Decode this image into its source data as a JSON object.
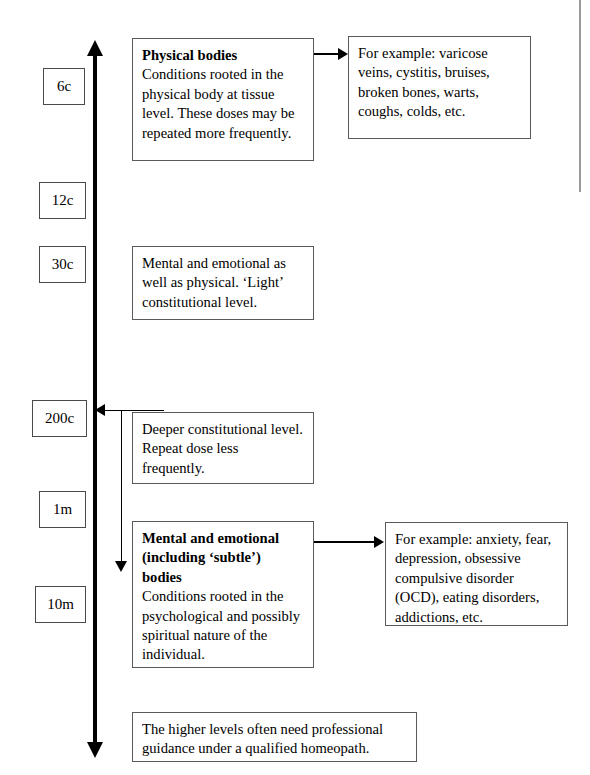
{
  "diagram": {
    "axis": {
      "name": "potency-axis",
      "direction": "vertical",
      "top_arrow": "up",
      "bottom_arrow": "down"
    },
    "potencies": [
      {
        "label": "6c",
        "id": "potency-6c"
      },
      {
        "label": "12c",
        "id": "potency-12c"
      },
      {
        "label": "30c",
        "id": "potency-30c"
      },
      {
        "label": "200c",
        "id": "potency-200c"
      },
      {
        "label": "1m",
        "id": "potency-1m"
      },
      {
        "label": "10m",
        "id": "potency-10m"
      }
    ],
    "boxes": {
      "physical": {
        "heading": "Physical bodies",
        "body": "Conditions rooted in the physical body at tissue level. These doses may be repeated more frequently."
      },
      "physical_examples": {
        "body": "For example: varicose veins, cystitis, bruises, broken bones, warts, coughs, colds, etc."
      },
      "light_constitutional": {
        "body": "Mental and emotional as well as physical. ‘Light’ constitutional level."
      },
      "deeper_constitutional": {
        "body": "Deeper constitutional level. Repeat dose less frequently."
      },
      "mental": {
        "heading": "Mental and emotional (including ‘subtle’) bodies",
        "body": "Conditions rooted in the psychological and possibly spiritual nature of the individual."
      },
      "mental_examples": {
        "body": "For example: anxiety, fear, depression, obsessive compulsive disorder (OCD), eating disorders, addictions, etc."
      },
      "footer_note": {
        "body": "The higher levels often need professional guidance under a qualified homeopath."
      }
    },
    "colors": {
      "ink": "#000000",
      "box_border": "#5a5a5a",
      "background": "#ffffff",
      "scan_edge": "#9a9a9a"
    }
  }
}
